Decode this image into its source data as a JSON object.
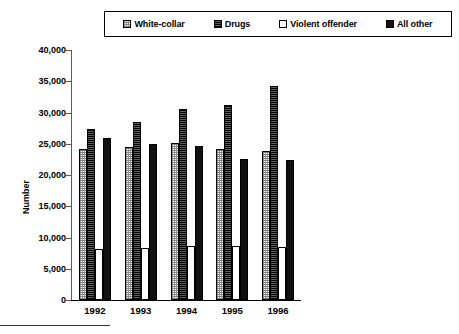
{
  "chart_data": {
    "type": "bar",
    "title": "",
    "subtitle": "",
    "xlabel": "",
    "ylabel": "Number",
    "categories": [
      "1992",
      "1993",
      "1994",
      "1995",
      "1996"
    ],
    "ylim": [
      0,
      40000
    ],
    "yticks": [
      0,
      5000,
      10000,
      15000,
      20000,
      25000,
      30000,
      35000,
      40000
    ],
    "ytick_labels": [
      "0",
      "5,000",
      "10,000",
      "15,000",
      "20,000",
      "25,000",
      "30,000",
      "35,000",
      "40,000"
    ],
    "grid": false,
    "legend_position": "top",
    "series": [
      {
        "name": "White-collar",
        "fill": "light-stipple",
        "color": "#d9d9d9",
        "values": [
          24200,
          24500,
          25100,
          24100,
          23800
        ]
      },
      {
        "name": "Drugs",
        "fill": "dark-stipple",
        "color": "#2b2b2b",
        "values": [
          27300,
          28500,
          30500,
          31200,
          34200
        ]
      },
      {
        "name": "Violent offender",
        "fill": "white",
        "color": "#ffffff",
        "values": [
          8200,
          8400,
          8600,
          8700,
          8500
        ]
      },
      {
        "name": "All other",
        "fill": "solid",
        "color": "#111111",
        "values": [
          26000,
          25000,
          24600,
          22600,
          22400
        ]
      }
    ]
  },
  "legend": {
    "entries": [
      {
        "label": "White-collar",
        "swatch": "light-stipple"
      },
      {
        "label": "Drugs",
        "swatch": "dark-stipple"
      },
      {
        "label": "Violent offender",
        "swatch": "white"
      },
      {
        "label": "All other",
        "swatch": "solid"
      }
    ]
  },
  "axes": {
    "y_axis_label": "Number"
  },
  "colors": {
    "axis": "#000000",
    "text": "#000000",
    "background": "#ffffff"
  }
}
